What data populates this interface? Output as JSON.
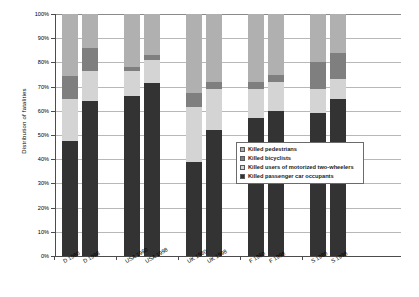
{
  "chart_data": {
    "type": "bar",
    "subtype": "stacked-percent-column",
    "title": "",
    "xlabel": "",
    "ylabel": "Distribution of fatalities",
    "ylim": [
      0,
      100
    ],
    "ytick_labels": [
      "100%",
      "90%",
      "80%",
      "70%",
      "60%",
      "50%",
      "40%",
      "30%",
      "20%",
      "10%",
      "0%"
    ],
    "ytick_values": [
      100,
      90,
      80,
      70,
      60,
      50,
      40,
      30,
      20,
      10,
      0
    ],
    "grid": true,
    "legend_position": "inside-right-middle",
    "categories": [
      "D 1980",
      "D 1998",
      "USA 1980",
      "USA 1998",
      "UK 1980",
      "UK 1998",
      "F 1980",
      "F 1998",
      "S 1980",
      "S 1998"
    ],
    "series": [
      {
        "name": "Killed passenger car occupants",
        "color": "#333333",
        "values": [
          47.5,
          64.0,
          66.0,
          71.5,
          39.0,
          52.0,
          57.0,
          60.0,
          59.0,
          65.0
        ]
      },
      {
        "name": "Killed users of motorized two-wheelers",
        "color": "#d4d4d4",
        "values": [
          17.5,
          12.5,
          10.5,
          9.5,
          22.5,
          17.0,
          12.0,
          12.0,
          10.0,
          8.0
        ]
      },
      {
        "name": "Killed bicyclists",
        "color": "#7f7f7f",
        "values": [
          9.5,
          9.5,
          1.5,
          2.0,
          6.0,
          3.0,
          3.0,
          3.0,
          11.0,
          11.0
        ]
      },
      {
        "name": "Killed pedestrians",
        "color": "#b0b0b0",
        "values": [
          25.5,
          14.0,
          22.0,
          17.0,
          32.5,
          28.0,
          28.0,
          25.0,
          20.0,
          16.0
        ]
      }
    ],
    "legend_entries": [
      "Killed pedestrians",
      "Killed bicyclists",
      "Killed users of motorized two-wheelers",
      "Killed passenger car occupants"
    ]
  }
}
